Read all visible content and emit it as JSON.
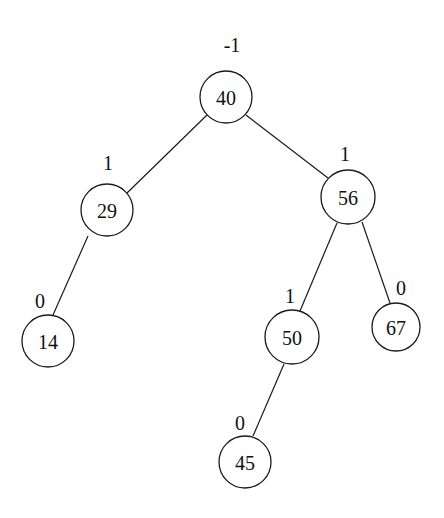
{
  "diagram": {
    "type": "avl-tree",
    "nodes": [
      {
        "id": "n40",
        "value": "40",
        "balance": "-1",
        "cx": 226,
        "cy": 97,
        "r": 26,
        "bx": 232,
        "by": 52
      },
      {
        "id": "n29",
        "value": "29",
        "balance": "1",
        "cx": 107,
        "cy": 210,
        "r": 26,
        "bx": 108,
        "by": 170
      },
      {
        "id": "n56",
        "value": "56",
        "balance": "1",
        "cx": 348,
        "cy": 197,
        "r": 27,
        "bx": 345,
        "by": 161
      },
      {
        "id": "n14",
        "value": "14",
        "balance": "0",
        "cx": 48,
        "cy": 341,
        "r": 26,
        "bx": 40,
        "by": 308
      },
      {
        "id": "n50",
        "value": "50",
        "balance": "1",
        "cx": 292,
        "cy": 337,
        "r": 27,
        "bx": 290,
        "by": 303
      },
      {
        "id": "n67",
        "value": "67",
        "balance": "0",
        "cx": 396,
        "cy": 327,
        "r": 24,
        "bx": 401,
        "by": 295
      },
      {
        "id": "n45",
        "value": "45",
        "balance": "0",
        "cx": 245,
        "cy": 462,
        "r": 26,
        "bx": 240,
        "by": 430
      }
    ],
    "edges": [
      {
        "from": "n40",
        "to": "n29",
        "x1": 207,
        "y1": 115,
        "x2": 127,
        "y2": 193
      },
      {
        "from": "n40",
        "to": "n56",
        "x1": 246,
        "y1": 115,
        "x2": 328,
        "y2": 178
      },
      {
        "from": "n29",
        "to": "n14",
        "x1": 88,
        "y1": 236,
        "x2": 53,
        "y2": 315
      },
      {
        "from": "n56",
        "to": "n50",
        "x1": 337,
        "y1": 223,
        "x2": 300,
        "y2": 311
      },
      {
        "from": "n56",
        "to": "n67",
        "x1": 362,
        "y1": 222,
        "x2": 390,
        "y2": 303
      },
      {
        "from": "n50",
        "to": "n45",
        "x1": 284,
        "y1": 364,
        "x2": 253,
        "y2": 436
      }
    ]
  }
}
